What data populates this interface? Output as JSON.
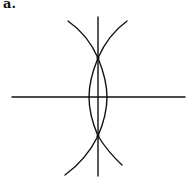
{
  "figure": {
    "label": "a.",
    "stroke_color": "#111111"
  }
}
